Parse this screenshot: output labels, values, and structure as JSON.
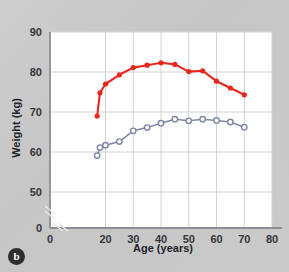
{
  "figure": {
    "panel_label": "b",
    "background_color": "#c9c9ca",
    "plot_background_color": "#ffffff"
  },
  "chart_data": {
    "type": "line",
    "title": "",
    "xlabel": "Age (years)",
    "ylabel": "Weight (kg)",
    "xlim": [
      0,
      80
    ],
    "ylim": [
      0,
      90
    ],
    "y_axis_break": true,
    "y_visible_min": 45,
    "grid": true,
    "legend_position": "none",
    "xticks": [
      0,
      20,
      30,
      40,
      50,
      60,
      70,
      80
    ],
    "xtick_labels": [
      "0",
      "20",
      "30",
      "40",
      "50",
      "60",
      "70",
      "80"
    ],
    "yticks": [
      0,
      50,
      60,
      70,
      80,
      90
    ],
    "ytick_labels": [
      "0",
      "50",
      "60",
      "70",
      "80",
      "90"
    ],
    "series": [
      {
        "name": "men",
        "color": "#e8281e",
        "marker": "filled-circle",
        "x": [
          17,
          18,
          20,
          25,
          30,
          35,
          40,
          45,
          50,
          55,
          60,
          65,
          70
        ],
        "values": [
          69.0,
          74.8,
          77.0,
          79.3,
          81.1,
          81.7,
          82.3,
          81.9,
          80.1,
          80.3,
          77.7,
          76.0,
          74.3
        ]
      },
      {
        "name": "women",
        "color": "#7c86a6",
        "marker": "open-circle",
        "x": [
          17,
          18,
          20,
          25,
          30,
          35,
          40,
          45,
          50,
          55,
          60,
          65,
          70
        ],
        "values": [
          59.1,
          61.1,
          61.7,
          62.6,
          65.3,
          66.1,
          67.2,
          68.2,
          67.8,
          68.2,
          67.9,
          67.5,
          66.2
        ]
      }
    ]
  }
}
